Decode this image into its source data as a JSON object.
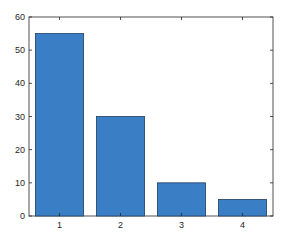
{
  "chart_data": {
    "type": "bar",
    "title": "",
    "xlabel": "",
    "ylabel": "",
    "categories": [
      "1",
      "2",
      "3",
      "4"
    ],
    "values": [
      55,
      30,
      10,
      5
    ],
    "ylim": [
      0,
      60
    ],
    "yticks": [
      0,
      10,
      20,
      30,
      40,
      50,
      60
    ],
    "grid": false,
    "legend": null,
    "bar_color": "#3a7fc6",
    "bar_edge_color": "#1f3f5f",
    "axis_color": "#262626"
  }
}
